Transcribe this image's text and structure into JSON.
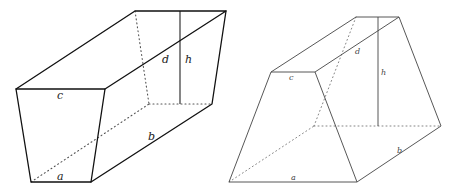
{
  "figure": {
    "left_solid": {
      "name": "Truncated prism with trapezoidal faces (wedge-like prismatoid)",
      "labels": {
        "a": "a",
        "b": "b",
        "c": "c",
        "d": "d",
        "h": "h"
      }
    },
    "right_solid": {
      "name": "Trapezoidal prismatoid",
      "labels": {
        "a": "a",
        "b": "b",
        "c": "c",
        "d": "d",
        "h": "h"
      }
    }
  }
}
